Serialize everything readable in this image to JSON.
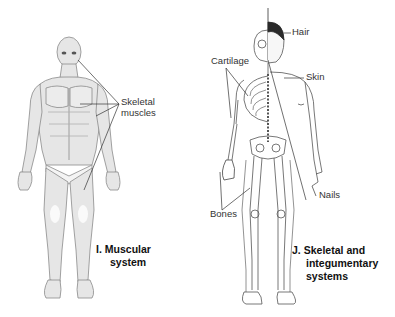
{
  "figures": [
    {
      "id": "I",
      "letter": "I.",
      "title_line1": "Muscular",
      "title_line2": "system",
      "labels": [
        {
          "text_line1": "Skeletal",
          "text_line2": "muscles"
        }
      ]
    },
    {
      "id": "J",
      "letter": "J.",
      "title_line1": "Skeletal and",
      "title_line2": "integumentary",
      "title_line3": "systems",
      "labels": [
        {
          "text": "Hair"
        },
        {
          "text": "Cartilage"
        },
        {
          "text": "Skin"
        },
        {
          "text": "Bones"
        },
        {
          "text": "Nails"
        }
      ]
    }
  ],
  "colors": {
    "line": "#444444",
    "muscle_fill": "#e4e4e4",
    "muscle_stroke": "#8a8a8a",
    "hair": "#2a2a2a",
    "bone_stroke": "#555555"
  }
}
